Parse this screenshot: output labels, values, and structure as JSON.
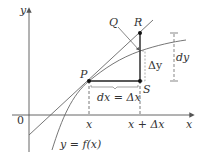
{
  "diagram": {
    "colors": {
      "axis": "#555555",
      "curve": "#666666",
      "tangent": "#666666",
      "triangle": "#222222",
      "dashed": "#555555",
      "text": "#333333"
    },
    "labels": {
      "y_axis": "y",
      "x_axis": "x",
      "origin": "0",
      "point_p": "P",
      "point_q": "Q",
      "point_r": "R",
      "point_s": "S",
      "dx_label": "dx = Δx",
      "delta_y": "Δy",
      "dy": "dy",
      "x_tick": "x",
      "x_plus_dx_tick": "x + Δx",
      "curve_label": "y = f(x)"
    }
  }
}
